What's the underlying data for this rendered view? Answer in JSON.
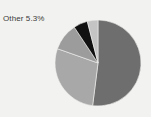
{
  "figure": {
    "background_color": "#f2f2f0"
  },
  "annotations": [
    {
      "name": "other-slice-label",
      "text": "Other 5.3%",
      "x": 3,
      "y": 14,
      "color": "#3a3a3a"
    }
  ],
  "chart_data": {
    "type": "pie",
    "title": "",
    "xlabel": "",
    "ylabel": "",
    "legend": false,
    "grid": false,
    "center": {
      "x": 98,
      "y": 63
    },
    "radius": 43,
    "start_angle_deg": -90,
    "direction": "clockwise",
    "labels": [
      "Segment 1",
      "Segment 2",
      "Segment 3",
      "Other",
      "Segment 5"
    ],
    "values": [
      52.0,
      28.4,
      10.3,
      5.3,
      4.0
    ],
    "data_labels": [
      "",
      "",
      "",
      "Other 5.3%",
      ""
    ],
    "colors": [
      "#6e6e6e",
      "#a8a8a8",
      "#9c9c9c",
      "#111111",
      "#c4c4c4"
    ],
    "slices": [
      {
        "label": "Segment 1",
        "value": 52.0,
        "color": "#6e6e6e",
        "shown_label": ""
      },
      {
        "label": "Segment 2",
        "value": 28.4,
        "color": "#a8a8a8",
        "shown_label": ""
      },
      {
        "label": "Segment 3",
        "value": 10.3,
        "color": "#9c9c9c",
        "shown_label": ""
      },
      {
        "label": "Other",
        "value": 5.3,
        "color": "#111111",
        "shown_label": "Other 5.3%"
      },
      {
        "label": "Segment 5",
        "value": 4.0,
        "color": "#c4c4c4",
        "shown_label": ""
      }
    ],
    "edge_color": "#f2f2f0",
    "edge_width": 0.6
  }
}
